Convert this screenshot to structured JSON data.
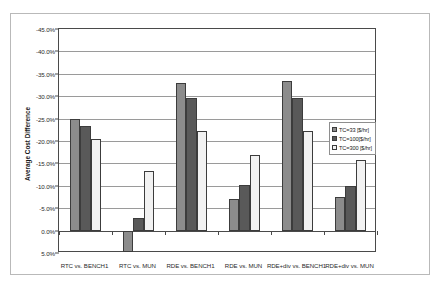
{
  "chart_data": {
    "type": "bar",
    "title": "",
    "xlabel": "",
    "ylabel": "Average Cost Difference",
    "ylim": [
      5.0,
      -45.0
    ],
    "y_axis_inverted": true,
    "grid": true,
    "legend_position": "right-middle",
    "yticks": [
      "-45.0%",
      "-40.0%",
      "-35.0%",
      "-30.0%",
      "-25.0%",
      "-20.0%",
      "-15.0%",
      "-10.0%",
      "-5.0%",
      "0.0%",
      "5.0%"
    ],
    "ytick_values": [
      -45.0,
      -40.0,
      -35.0,
      -30.0,
      -25.0,
      -20.0,
      -15.0,
      -10.0,
      -5.0,
      0.0,
      5.0
    ],
    "categories": [
      "RTC vs. BENCH1",
      "RTC vs. MUN",
      "RDE vs. BENCH1",
      "RDE vs. MUN",
      "RDE+div vs. BENCH1",
      "RDE+div vs. MUN"
    ],
    "series": [
      {
        "name": "TC=33 [$/hr]",
        "color": "#8c8c8c",
        "values": [
          -24.8,
          4.7,
          -33.0,
          -7.0,
          -33.3,
          -7.4
        ]
      },
      {
        "name": "TC=100[$/hr]",
        "color": "#595959",
        "values": [
          -23.4,
          -2.9,
          -29.7,
          -10.1,
          -29.7,
          -9.9
        ]
      },
      {
        "name": "TC=300 [$/hr]",
        "color": "#f2f2f2",
        "values": [
          -20.4,
          -13.3,
          -22.3,
          -16.9,
          -22.3,
          -15.8
        ]
      }
    ]
  },
  "legend": {
    "items": [
      {
        "label": "TC=33 [$/hr]"
      },
      {
        "label": "TC=100[$/hr]"
      },
      {
        "label": "TC=300 [$/hr]"
      }
    ]
  }
}
